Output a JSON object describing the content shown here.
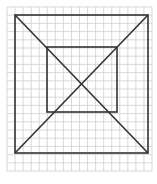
{
  "diagram": {
    "type": "geometric-figure",
    "canvas": {
      "width": 157,
      "height": 184,
      "background": "#ffffff"
    },
    "grid": {
      "x0": 7,
      "y0": 7,
      "x1": 152,
      "y1": 171,
      "cols": 18,
      "rows": 20,
      "color": "#cfcfcf"
    },
    "outer_square": {
      "x": 15,
      "y": 15,
      "width": 133,
      "height": 138,
      "stroke": "#333333"
    },
    "inner_square": {
      "x": 47,
      "y": 47,
      "width": 70,
      "height": 65,
      "stroke": "#333333"
    },
    "diagonals": [
      {
        "x1": 15,
        "y1": 15,
        "x2": 148,
        "y2": 153
      },
      {
        "x1": 148,
        "y1": 15,
        "x2": 15,
        "y2": 153
      }
    ],
    "stroke_color": "#333333",
    "stroke_width": 1.6
  }
}
